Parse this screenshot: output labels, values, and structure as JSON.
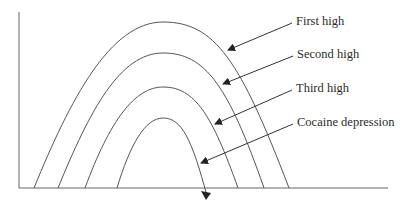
{
  "diagram": {
    "type": "conceptual-curve-diagram",
    "axes": {
      "x_label": "",
      "y_label": ""
    },
    "curves": [
      {
        "id": "first-high",
        "label": "First high",
        "peak_y": 22,
        "base_left": 34,
        "base_right": 289
      },
      {
        "id": "second-high",
        "label": "Second high",
        "peak_y": 53,
        "base_left": 58,
        "base_right": 264
      },
      {
        "id": "third-high",
        "label": "Third high",
        "peak_y": 87,
        "base_left": 85,
        "base_right": 238
      },
      {
        "id": "cocaine-depression",
        "label": "Cocaine depression",
        "peak_y": 118,
        "base_left": 117,
        "base_right": 205
      }
    ],
    "labels": {
      "first": "First high",
      "second": "Second high",
      "third": "Third high",
      "fourth": "Cocaine depression"
    },
    "colors": {
      "line": "#555555",
      "text": "#2b2b2b",
      "background": "#ffffff"
    }
  }
}
